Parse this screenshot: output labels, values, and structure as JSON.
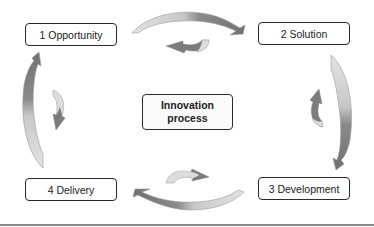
{
  "diagram": {
    "title": "Innovation process",
    "center": {
      "line1": "Innovation",
      "line2": "process"
    },
    "stages": [
      {
        "number": "1",
        "label": "1 Opportunity"
      },
      {
        "number": "2",
        "label": "2 Solution"
      },
      {
        "number": "3",
        "label": "3 Development"
      },
      {
        "number": "4",
        "label": "4 Delivery"
      }
    ],
    "colors": {
      "arrow_dark": "#7a7a7a",
      "arrow_light": "#dedede",
      "border": "#2a2a2a",
      "rule": "#8a8a8a"
    }
  }
}
